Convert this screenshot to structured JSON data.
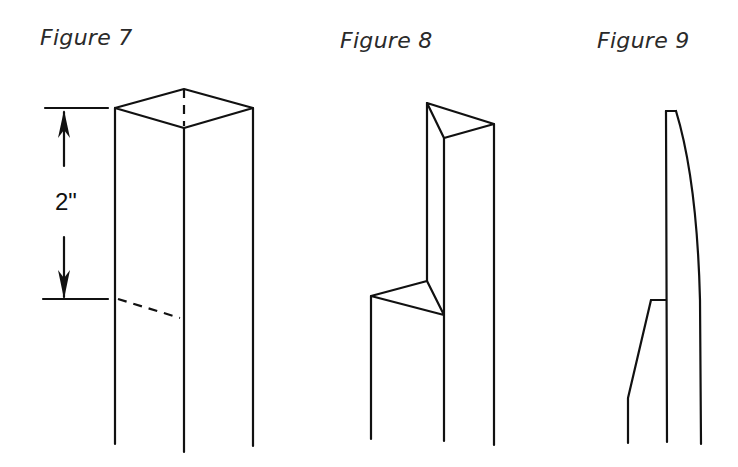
{
  "figures": [
    {
      "id": "fig7",
      "title": "Figure 7",
      "dimension_label": "2\""
    },
    {
      "id": "fig8",
      "title": "Figure 8"
    },
    {
      "id": "fig9",
      "title": "Figure 9"
    }
  ],
  "colors": {
    "line": "#111111",
    "background": "#ffffff"
  }
}
